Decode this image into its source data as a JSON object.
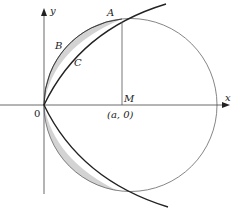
{
  "diagram": {
    "type": "geometry",
    "labels": {
      "x_axis": "x",
      "y_axis": "y",
      "origin": "0",
      "point_A": "A",
      "point_B": "B",
      "point_C": "C",
      "point_M": "M",
      "center": "(a, 0)"
    },
    "colors": {
      "curve": "#222222",
      "circle": "#555555",
      "shade": "#d0d0d0",
      "axis": "#333333"
    }
  }
}
